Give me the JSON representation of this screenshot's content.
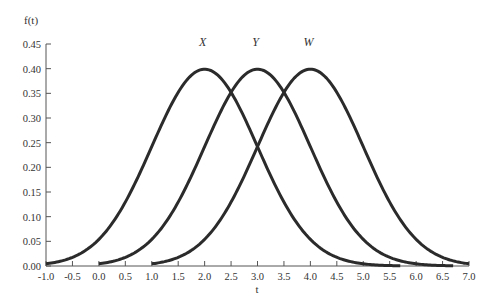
{
  "chart_data": {
    "type": "line",
    "title": "",
    "xlabel": "t",
    "ylabel": "f(t)",
    "xlim": [
      -1.0,
      7.0
    ],
    "ylim": [
      0.0,
      0.45
    ],
    "x_ticks": [
      "-1.0",
      "-0.5",
      "0.0",
      "0.5",
      "1.0",
      "1.5",
      "2.0",
      "2.5",
      "3.0",
      "3.5",
      "4.0",
      "4.5",
      "5.0",
      "5.5",
      "6.0",
      "6.5",
      "7.0"
    ],
    "y_ticks": [
      "0.00",
      "0.05",
      "0.10",
      "0.15",
      "0.20",
      "0.25",
      "0.30",
      "0.35",
      "0.40",
      "0.45"
    ],
    "grid": false,
    "legend": "inline labels above peaks",
    "series": [
      {
        "name": "X",
        "distribution": "normal",
        "mean": 2.0,
        "sd": 1.0,
        "peak": 0.4,
        "x_start": -1.0,
        "x_end": 5.7
      },
      {
        "name": "Y",
        "distribution": "normal",
        "mean": 3.0,
        "sd": 1.0,
        "peak": 0.4,
        "x_start": 0.0,
        "x_end": 6.7
      },
      {
        "name": "W",
        "distribution": "normal",
        "mean": 4.0,
        "sd": 1.0,
        "peak": 0.4,
        "x_start": 1.0,
        "x_end": 7.0
      }
    ],
    "color": "#2b2b2b"
  }
}
